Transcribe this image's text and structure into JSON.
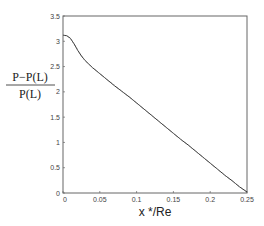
{
  "chart_data": {
    "type": "line",
    "title": "",
    "xlabel": "x */Re",
    "ylabel_numerator": "P−P(L)",
    "ylabel_denominator": "P(L)",
    "xlim": [
      0,
      0.25
    ],
    "ylim": [
      0,
      3.5
    ],
    "grid": false,
    "legend": null,
    "x_ticks": [
      0,
      0.05,
      0.1,
      0.15,
      0.2,
      0.25
    ],
    "x_tick_labels": [
      "0",
      "0.05",
      "0.1",
      "0.15",
      "0.2",
      "0.25"
    ],
    "y_ticks": [
      0,
      0.5,
      1,
      1.5,
      2,
      2.5,
      3,
      3.5
    ],
    "y_tick_labels": [
      "0",
      "0.5",
      "1",
      "1.5",
      "2",
      "2.5",
      "3",
      "3.5"
    ],
    "series": [
      {
        "name": "pressure drop (solid)",
        "style": "solid",
        "x": [
          0,
          0.005,
          0.01,
          0.015,
          0.02,
          0.025,
          0.03,
          0.035,
          0.04,
          0.05,
          0.06,
          0.07,
          0.08,
          0.09,
          0.1,
          0.11,
          0.12,
          0.13,
          0.14,
          0.15,
          0.16,
          0.17,
          0.18,
          0.19,
          0.2,
          0.21,
          0.22,
          0.23,
          0.24,
          0.25
        ],
        "values": [
          3.12,
          3.11,
          3.06,
          2.95,
          2.82,
          2.71,
          2.62,
          2.55,
          2.48,
          2.36,
          2.24,
          2.12,
          2.01,
          1.9,
          1.78,
          1.66,
          1.54,
          1.42,
          1.3,
          1.18,
          1.06,
          0.95,
          0.83,
          0.71,
          0.59,
          0.47,
          0.35,
          0.24,
          0.12,
          0.02
        ]
      },
      {
        "name": "pressure drop (dashed)",
        "style": "dashed",
        "x": [
          0,
          0.005,
          0.01,
          0.015,
          0.02,
          0.025,
          0.03,
          0.035,
          0.04,
          0.05,
          0.06,
          0.07,
          0.08,
          0.09,
          0.1,
          0.11,
          0.12,
          0.13,
          0.14,
          0.15,
          0.16,
          0.17,
          0.18,
          0.19,
          0.2,
          0.21,
          0.22,
          0.23,
          0.24,
          0.25
        ],
        "values": [
          3.12,
          3.11,
          3.06,
          2.95,
          2.83,
          2.72,
          2.62,
          2.55,
          2.48,
          2.36,
          2.24,
          2.13,
          2.01,
          1.9,
          1.78,
          1.66,
          1.54,
          1.42,
          1.3,
          1.18,
          1.06,
          0.95,
          0.83,
          0.71,
          0.59,
          0.47,
          0.35,
          0.24,
          0.12,
          0.02
        ]
      }
    ]
  },
  "colors": {
    "axis": "#555555",
    "line": "#333333",
    "background": "#ffffff"
  }
}
